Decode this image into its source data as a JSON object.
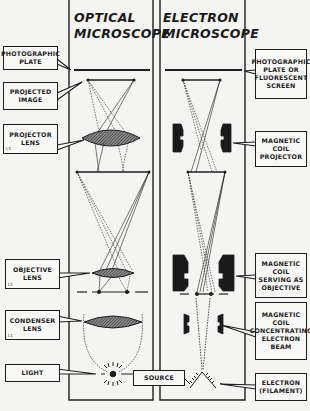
{
  "columns": {
    "optical": {
      "title": "OPTICAL\nMICROSCOPE"
    },
    "electron": {
      "title": "ELECTRON\nMICROSCOPE"
    }
  },
  "left_labels": [
    {
      "id": "photographic-plate",
      "text": "PHOTOGRAPHIC\nPLATE",
      "sub": ""
    },
    {
      "id": "projected-image",
      "text": "PROJECTED\nIMAGE",
      "sub": ""
    },
    {
      "id": "projector-lens",
      "text": "PROJECTOR\nLENS",
      "sub": "L3"
    },
    {
      "id": "objective-lens",
      "text": "OBJECTIVE\nLENS",
      "sub": "L2"
    },
    {
      "id": "condenser-lens",
      "text": "CONDENSER\nLENS",
      "sub": "L1"
    },
    {
      "id": "light",
      "text": "LIGHT",
      "sub": ""
    }
  ],
  "right_labels": [
    {
      "id": "photographic-plate-or-screen",
      "text": "PHOTOGRAPHIC\nPLATE OR\nFLUORESCENT\nSCREEN"
    },
    {
      "id": "magnetic-coil-projector",
      "text": "MAGNETIC\nCOIL\nPROJECTOR"
    },
    {
      "id": "magnetic-coil-objective",
      "text": "MAGNETIC\nCOIL\nSERVING AS\nOBJECTIVE"
    },
    {
      "id": "magnetic-coil-condenser",
      "text": "MAGNETIC\nCOIL\nCONCENTRATING\nELECTRON\nBEAM"
    },
    {
      "id": "electron-filament",
      "text": "ELECTRON\n(FILAMENT)"
    }
  ],
  "center_label": {
    "text": "SOURCE"
  },
  "colors": {
    "ink": "#1e1e1e",
    "paper": "#f4f4f2",
    "lens_fill": "#6e6e6e",
    "coil_fill": "#1a1a1a"
  }
}
